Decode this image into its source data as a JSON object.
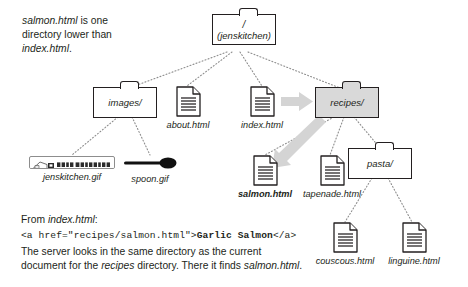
{
  "figure": {
    "type": "directory-tree-diagram",
    "background": "#ffffff",
    "ink_color": "#231f20",
    "highlight_color": "#d9d9d9"
  },
  "note": {
    "line1_em": "salmon.html",
    "line1_rest": " is one",
    "line2": "directory lower than",
    "line3_em": "index.html",
    "line3_rest": "."
  },
  "tree": {
    "root": {
      "slash": "/",
      "label": "(jenskitchen)"
    },
    "nodes": {
      "images_folder": "images/",
      "about_file": "about.html",
      "index_file": "index.html",
      "recipes_folder": "recipes/",
      "jenskitchen_gif": "jenskitchen.gif",
      "spoon_gif": "spoon.gif",
      "salmon_file": "salmon.html",
      "tapenade_file": "tapenade.html",
      "pasta_folder": "pasta/",
      "couscous_file": "couscous.html",
      "linguine_file": "linguine.html"
    },
    "banner_text": "Jen's Kitchen"
  },
  "explanation": {
    "from_prefix": "From ",
    "from_em": "index.html",
    "from_suffix": ":",
    "code_plain_1": "<a href=\"",
    "code_path": "recipes/salmon.html",
    "code_plain_2": "\">",
    "code_bold": "Garlic Salmon",
    "code_plain_3": "</a>",
    "body_1": "The server looks in the same directory as the current",
    "body_2_a": "document for the ",
    "body_2_em": "recipes",
    "body_2_b": " directory. There it finds ",
    "body_2_em2": "salmon.html",
    "body_2_c": "."
  }
}
